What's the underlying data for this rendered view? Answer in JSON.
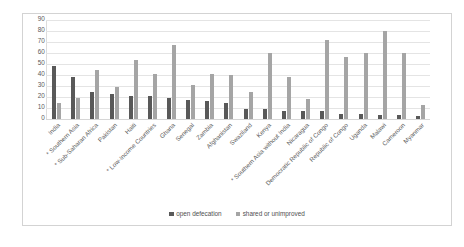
{
  "chart_data": {
    "type": "bar",
    "title": "",
    "subtitle": "",
    "xlabel": "",
    "ylabel": "",
    "ylim": [
      0,
      90
    ],
    "ytick_step": 10,
    "yticks": [
      90,
      80,
      70,
      60,
      50,
      40,
      30,
      20,
      10,
      0
    ],
    "grid": true,
    "grid_orientation": "horizontal",
    "legend_position": "bottom-center",
    "bar_layout": "grouped",
    "categories": [
      "India",
      "Southern Asia *",
      "Sub-Saharan Africa *",
      "Pakistan",
      "Haiti",
      "Low-Income Countries *",
      "Ghana",
      "Senegal",
      "Zambia",
      "Afghanistan",
      "Swaziland",
      "Kenya",
      "Southern Asia without India *",
      "Nicaragua",
      "Democratic Republic of Congo",
      "Republic of Congo",
      "Uganda",
      "Malawi",
      "Cameroon",
      "Myanmar"
    ],
    "series": [
      {
        "name": "open defecation",
        "color": "#595959",
        "values": [
          48,
          38,
          25,
          23,
          21,
          21,
          19,
          17,
          16,
          15,
          9,
          9,
          7,
          7,
          7,
          5,
          5,
          4,
          4,
          3
        ]
      },
      {
        "name": "shared or unimproved",
        "color": "#a5a5a5",
        "values": [
          15,
          19,
          45,
          29,
          54,
          41,
          67,
          31,
          41,
          40,
          25,
          60,
          38,
          18,
          72,
          56,
          60,
          80,
          60,
          13
        ]
      }
    ]
  },
  "legend": {
    "items": [
      {
        "label": "open defecation",
        "color": "#595959"
      },
      {
        "label": "shared or unimproved",
        "color": "#a5a5a5"
      }
    ]
  },
  "colors": {
    "series_open_defecation": "#595959",
    "series_shared_or_unimproved": "#a5a5a5",
    "gridline": "#e4e4e4",
    "frame_border": "#d3d3d3",
    "axis_text": "#5a5a5a",
    "background": "#ffffff"
  }
}
